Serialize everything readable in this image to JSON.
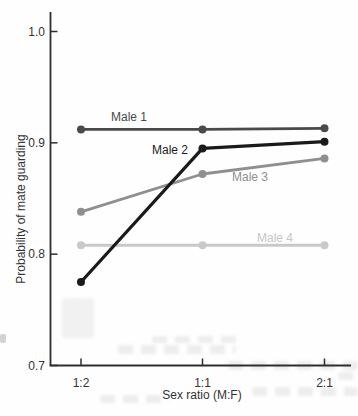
{
  "figure": {
    "background_color": "#fefefe",
    "axis_color": "#2e2e2e",
    "text_color": "#333333"
  },
  "chart_data": {
    "type": "line",
    "title": "",
    "xlabel": "Sex ratio (M:F)",
    "ylabel": "Probability of mate guarding",
    "categories": [
      "1:2",
      "1:1",
      "2:1"
    ],
    "ylim": [
      0.7,
      1.0
    ],
    "y_ticks": [
      {
        "label": "1.0",
        "value": 1.0
      },
      {
        "label": "0.9",
        "value": 0.9
      },
      {
        "label": "0.8",
        "value": 0.8
      },
      {
        "label": "0.7",
        "value": 0.7
      }
    ],
    "grid": false,
    "legend": "inline labels beside each line",
    "series": [
      {
        "name": "Male 1",
        "color": "#4a4a4a",
        "label_color": "#4a4a4a",
        "line_width": 2.8,
        "values": [
          0.912,
          0.912,
          0.913
        ]
      },
      {
        "name": "Male 2",
        "color": "#1a1a1a",
        "label_color": "#1a1a1a",
        "line_width": 3.2,
        "values": [
          0.775,
          0.895,
          0.901
        ]
      },
      {
        "name": "Male 3",
        "color": "#8f8f8f",
        "label_color": "#8f8f8f",
        "line_width": 2.8,
        "values": [
          0.838,
          0.872,
          0.886
        ]
      },
      {
        "name": "Male 4",
        "color": "#c9c9c9",
        "label_color": "#c6c6c6",
        "line_width": 2.8,
        "values": [
          0.808,
          0.808,
          0.808
        ]
      }
    ]
  }
}
